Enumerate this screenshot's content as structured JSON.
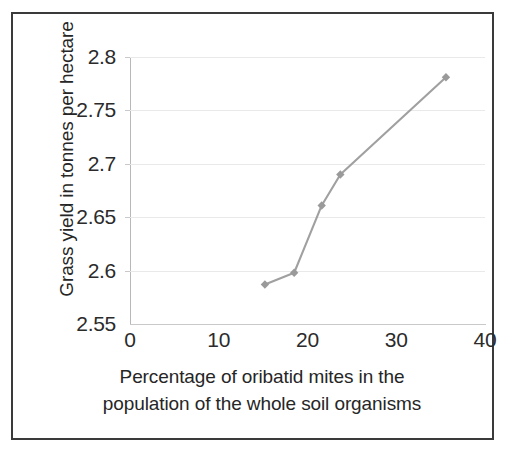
{
  "chart_data": {
    "type": "line",
    "title": "",
    "xlabel": "Percentage of oribatid mites in the population of the whole soil organisms",
    "xlabel_line1": "Percentage of oribatid mites in the",
    "xlabel_line2": "population of the whole soil organisms",
    "ylabel": "Grass yield in tonnes per hectare",
    "xlim": [
      0,
      40
    ],
    "ylim": [
      2.55,
      2.8
    ],
    "xticks": [
      0,
      10,
      20,
      30,
      40
    ],
    "xtick_labels": [
      "0",
      "10",
      "20",
      "30",
      "40"
    ],
    "yticks": [
      2.55,
      2.6,
      2.65,
      2.7,
      2.75,
      2.8
    ],
    "ytick_labels": [
      "2.55",
      "2.6",
      "2.65",
      "2.7",
      "2.75",
      "2.8"
    ],
    "grid": "horizontal",
    "legend": "none",
    "series": [
      {
        "name": "Grass yield",
        "color": "#a0a0a0",
        "marker": "diamond",
        "x": [
          15.2,
          18.5,
          21.6,
          23.7,
          35.6
        ],
        "y": [
          2.587,
          2.598,
          2.661,
          2.69,
          2.781
        ],
        "points": [
          {
            "x": 15.2,
            "y": 2.587
          },
          {
            "x": 18.5,
            "y": 2.598
          },
          {
            "x": 21.6,
            "y": 2.661
          },
          {
            "x": 23.7,
            "y": 2.69
          },
          {
            "x": 35.6,
            "y": 2.781
          }
        ]
      }
    ],
    "colors": {
      "line": "#a0a0a0",
      "marker": "#9a9a9a",
      "grid": "#e9e9e9",
      "axis": "#c9c9c9",
      "text": "#2b2b2b",
      "frame": "#3a3a3a",
      "background": "#ffffff"
    }
  }
}
